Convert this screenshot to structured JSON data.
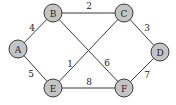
{
  "graph": {
    "nodes": [
      {
        "id": "A",
        "label": "A",
        "x": 18,
        "y": 49
      },
      {
        "id": "B",
        "label": "B",
        "x": 53,
        "y": 13
      },
      {
        "id": "C",
        "label": "C",
        "x": 124,
        "y": 13
      },
      {
        "id": "D",
        "label": "D",
        "x": 160,
        "y": 52
      },
      {
        "id": "E",
        "label": "E",
        "x": 53,
        "y": 88
      },
      {
        "id": "F",
        "label": "F",
        "x": 124,
        "y": 88
      }
    ],
    "edges": [
      {
        "from": "A",
        "to": "B",
        "weight": "4",
        "lx": 32,
        "ly": 28
      },
      {
        "from": "B",
        "to": "C",
        "weight": "2",
        "lx": 89,
        "ly": 6
      },
      {
        "from": "C",
        "to": "D",
        "weight": "3",
        "lx": 147,
        "ly": 28
      },
      {
        "from": "A",
        "to": "E",
        "weight": "5",
        "lx": 31,
        "ly": 74
      },
      {
        "from": "E",
        "to": "F",
        "weight": "8",
        "lx": 89,
        "ly": 82
      },
      {
        "from": "F",
        "to": "D",
        "weight": "7",
        "lx": 147,
        "ly": 75
      },
      {
        "from": "B",
        "to": "F",
        "weight": "6",
        "lx": 107,
        "ly": 63
      },
      {
        "from": "E",
        "to": "C",
        "weight": "1",
        "lx": 70,
        "ly": 64
      }
    ]
  }
}
